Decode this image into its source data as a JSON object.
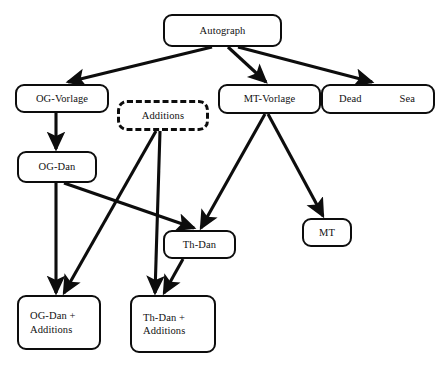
{
  "diagram": {
    "background_color": "#ffffff",
    "stroke_color": "#0d0d0d",
    "nodes": [
      {
        "id": "autograph",
        "label": "Autograph",
        "x": 163,
        "y": 14,
        "w": 119,
        "h": 33,
        "style": "solid"
      },
      {
        "id": "og-vorlage",
        "label": "OG-Vorlage",
        "x": 15,
        "y": 84,
        "w": 94,
        "h": 29,
        "style": "solid"
      },
      {
        "id": "additions",
        "label": "Additions",
        "x": 117,
        "y": 100,
        "w": 92,
        "h": 31,
        "style": "dashed"
      },
      {
        "id": "mt-vorlage",
        "label": "MT-Vorlage",
        "x": 218,
        "y": 84,
        "w": 103,
        "h": 30,
        "style": "solid"
      },
      {
        "id": "dead-sea",
        "label": "Dead",
        "label2": "Sea",
        "x": 321,
        "y": 84,
        "w": 114,
        "h": 30,
        "style": "solid"
      },
      {
        "id": "og-dan",
        "label": "OG-Dan",
        "x": 17,
        "y": 151,
        "w": 80,
        "h": 32,
        "style": "solid"
      },
      {
        "id": "th-dan",
        "label": "Th-Dan",
        "x": 163,
        "y": 230,
        "w": 73,
        "h": 29,
        "style": "solid"
      },
      {
        "id": "mt",
        "label": "MT",
        "x": 302,
        "y": 218,
        "w": 50,
        "h": 29,
        "style": "solid"
      },
      {
        "id": "og-dan-add",
        "label": "OG-Dan +\nAdditions",
        "x": 17,
        "y": 295,
        "w": 84,
        "h": 55,
        "style": "solid"
      },
      {
        "id": "th-dan-add",
        "label": "Th-Dan +\nAdditions",
        "x": 130,
        "y": 295,
        "w": 86,
        "h": 58,
        "style": "solid"
      }
    ],
    "edges": [
      {
        "id": "autograph-to-og-vorlage",
        "from": "autograph",
        "to": "og-vorlage"
      },
      {
        "id": "autograph-to-mt-vorlage",
        "from": "autograph",
        "to": "mt-vorlage"
      },
      {
        "id": "autograph-to-dead-sea",
        "from": "autograph",
        "to": "dead-sea"
      },
      {
        "id": "og-vorlage-to-og-dan",
        "from": "og-vorlage",
        "to": "og-dan"
      },
      {
        "id": "og-dan-to-og-dan-add",
        "from": "og-dan",
        "to": "og-dan-add"
      },
      {
        "id": "og-dan-to-th-dan",
        "from": "og-dan",
        "to": "th-dan"
      },
      {
        "id": "additions-to-og-dan-add",
        "from": "additions",
        "to": "og-dan-add"
      },
      {
        "id": "additions-to-th-dan-add",
        "from": "additions",
        "to": "th-dan-add"
      },
      {
        "id": "mt-vorlage-to-th-dan",
        "from": "mt-vorlage",
        "to": "th-dan"
      },
      {
        "id": "mt-vorlage-to-mt",
        "from": "mt-vorlage",
        "to": "mt"
      },
      {
        "id": "th-dan-to-th-dan-add",
        "from": "th-dan",
        "to": "th-dan-add"
      }
    ]
  }
}
